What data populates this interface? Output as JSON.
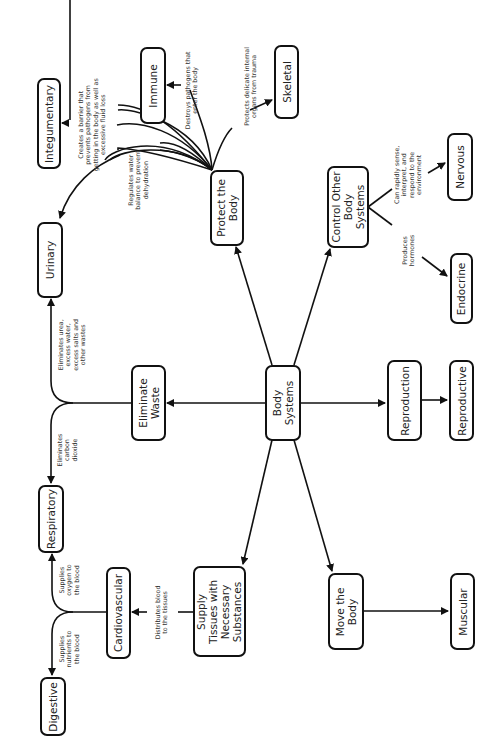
{
  "diagram": {
    "root": {
      "label": "Body\nSystems"
    },
    "functions": [
      {
        "id": "protect",
        "label": "Protect the\nBody"
      },
      {
        "id": "control",
        "label": "Control Other\nBody\nSystems"
      },
      {
        "id": "eliminate",
        "label": "Eliminate\nWaste"
      },
      {
        "id": "reproduction",
        "label": "Reproduction"
      },
      {
        "id": "supply",
        "label": "Supply\nTissues with\nNecessary\nSubstances"
      },
      {
        "id": "move",
        "label": "Move the\nBody"
      }
    ],
    "systems": [
      {
        "id": "urinary",
        "label": "Urinary"
      },
      {
        "id": "respiratory",
        "label": "Respiratory"
      },
      {
        "id": "cardiovascular",
        "label": "Cardiovascular"
      },
      {
        "id": "digestive",
        "label": "Digestive"
      },
      {
        "id": "integumentary",
        "label": "Integumentary"
      },
      {
        "id": "immune",
        "label": "Immune"
      },
      {
        "id": "skeletal",
        "label": "Skeletal"
      },
      {
        "id": "nervous",
        "label": "Nervous"
      },
      {
        "id": "endocrine",
        "label": "Endocrine"
      },
      {
        "id": "reproductive",
        "label": "Reproductive"
      },
      {
        "id": "muscular",
        "label": "Muscular"
      }
    ],
    "edge_labels": {
      "integumentary": "Creates a barrier that\nprevents pathogens from\ngetting in the body as well as\nexcessive fluid loss",
      "urinary_water": "Regulates water\nbalance to prevent\ndehydration",
      "immune": "Destroys pathogens that\nenter the body",
      "skeletal": "Protects delicate internal\norgans from trauma",
      "urinary_waste": "Eliminates urea,\nexcess water,\nexcess salts and\nother wastes",
      "respiratory_co2": "Eliminates\ncarbon\ndioxide",
      "respiratory_o2": "Supplies\noxygen to\nthe blood",
      "digestive": "Supplies\nnutrients to\nthe blood",
      "cardiovascular": "Distributes blood\nto the tissues",
      "nervous": "Can rapidly sense,\ninterpret, and\nrespond to the\nenvironment",
      "endocrine": "Produces\nhormones"
    }
  }
}
